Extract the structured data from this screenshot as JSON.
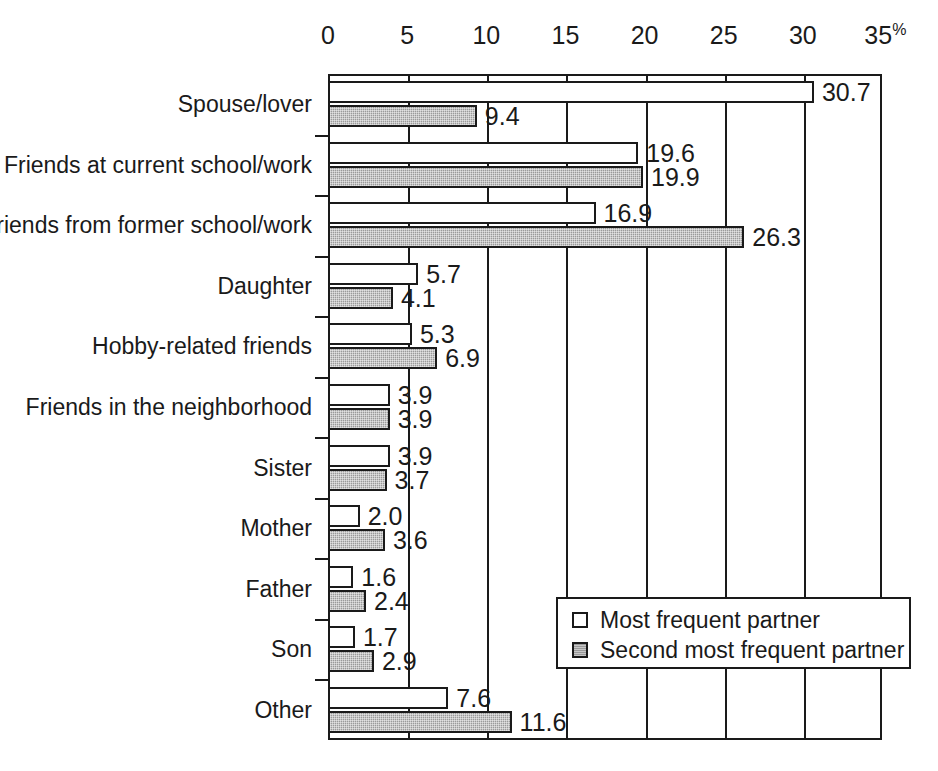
{
  "chart_data": {
    "type": "bar",
    "orientation": "horizontal",
    "title": "",
    "xlabel": "%",
    "ylabel": "",
    "xlim": [
      0,
      35
    ],
    "xticks": [
      0,
      5,
      10,
      15,
      20,
      25,
      30,
      35
    ],
    "xtick_labels": [
      "0",
      "5",
      "10",
      "15",
      "20",
      "25",
      "30",
      "35"
    ],
    "x_unit_suffix": "%",
    "grid": true,
    "grid_axis": "x",
    "legend_position": "bottom-right",
    "categories": [
      "Spouse/lover",
      "Friends at current school/work",
      "Friends from former school/work",
      "Daughter",
      "Hobby-related friends",
      "Friends in the neighborhood",
      "Sister",
      "Mother",
      "Father",
      "Son",
      "Other"
    ],
    "series": [
      {
        "name": "Most frequent partner",
        "color": "#ffffff",
        "values": [
          30.7,
          19.6,
          16.9,
          5.7,
          5.3,
          3.9,
          3.9,
          2.0,
          1.6,
          1.7,
          7.6
        ],
        "labels": [
          "30.7",
          "19.6",
          "16.9",
          "5.7",
          "5.3",
          "3.9",
          "3.9",
          "2.0",
          "1.6",
          "1.7",
          "7.6"
        ]
      },
      {
        "name": "Second most frequent partner",
        "color": "#9a9a9a",
        "values": [
          9.4,
          19.9,
          26.3,
          4.1,
          6.9,
          3.9,
          3.7,
          3.6,
          2.4,
          2.9,
          11.6
        ],
        "labels": [
          "9.4",
          "19.9",
          "26.3",
          "4.1",
          "6.9",
          "3.9",
          "3.7",
          "3.6",
          "2.4",
          "2.9",
          "11.6"
        ]
      }
    ]
  },
  "legend": {
    "entries": [
      {
        "label": "Most frequent partner",
        "swatch": "white-square-swatch"
      },
      {
        "label": "Second most frequent partner",
        "swatch": "gray-square-swatch"
      }
    ]
  }
}
